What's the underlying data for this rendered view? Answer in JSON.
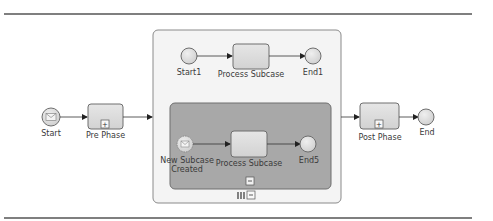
{
  "diagram": {
    "type": "BPMN process",
    "colors": {
      "rule": "#555555",
      "outer_subprocess_fill": "#f4f4f4",
      "outer_subprocess_stroke": "#8a8a8a",
      "inner_subprocess_fill": "#a8a8a8",
      "inner_subprocess_stroke": "#6e6e6e",
      "task_fill": "#dcdcdc",
      "task_stroke": "#6e6e6e",
      "event_fill": "#dcdcdc",
      "flow": "#333333"
    },
    "events": {
      "start": {
        "label": "Start",
        "icon": "envelope-icon"
      },
      "start1": {
        "label": "Start1"
      },
      "end1": {
        "label": "End1"
      },
      "new_subcase": {
        "label_line1": "New Subcase",
        "label_line2": "Created",
        "icon": "envelope-icon"
      },
      "end5": {
        "label": "End5"
      },
      "end": {
        "label": "End"
      }
    },
    "tasks": {
      "pre_phase": {
        "label": "Pre Phase",
        "marker": "+"
      },
      "process_subcase_top": {
        "label": "Process Subcase"
      },
      "process_subcase_inner": {
        "label": "Process Subcase"
      },
      "post_phase": {
        "label": "Post Phase",
        "marker": "+"
      }
    },
    "subprocess_markers": {
      "inner_collapse": "−",
      "outer_parallel": "III",
      "outer_collapse": "−"
    }
  }
}
